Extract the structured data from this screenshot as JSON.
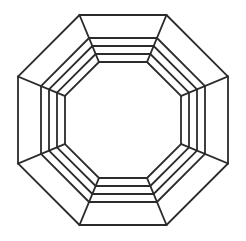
{
  "figure": {
    "type": "line-drawing",
    "background_color": "#ffffff",
    "stroke_color": "#2b2b2b",
    "stroke_width": 1.8,
    "canvas": {
      "width": 246,
      "height": 241
    },
    "center": {
      "x": 123,
      "y": 120
    },
    "rotation_degrees": 22.5,
    "ring_count": 8,
    "vertex_count": 8,
    "rings": [
      {
        "name": "ring-outer",
        "index": 0,
        "apothem": 105,
        "flat_top_y": 15,
        "flat_bottom_y": 225,
        "flat_left_x": 18,
        "flat_right_x": 228
      },
      {
        "name": "ring-second",
        "index": 1,
        "apothem": 82,
        "flat_top_y": 38,
        "flat_bottom_y": 202,
        "flat_left_x": 41,
        "flat_right_x": 205
      },
      {
        "name": "ring-third",
        "index": 2,
        "apothem": 74,
        "flat_top_y": 46,
        "flat_bottom_y": 194,
        "flat_left_x": 49,
        "flat_right_x": 197
      },
      {
        "name": "ring-fourth",
        "index": 3,
        "apothem": 66,
        "flat_top_y": 54,
        "flat_bottom_y": 186,
        "flat_left_x": 57,
        "flat_right_x": 189
      },
      {
        "name": "ring-inner",
        "index": 4,
        "apothem": 58,
        "flat_top_y": 62,
        "flat_bottom_y": 178,
        "flat_left_x": 65,
        "flat_right_x": 181
      }
    ],
    "connectors": [
      {
        "name": "connector-vertex-0",
        "angle_degrees": 22.5,
        "from_ring": 0,
        "to_ring": 4
      },
      {
        "name": "connector-vertex-1",
        "angle_degrees": 67.5,
        "from_ring": 0,
        "to_ring": 4
      },
      {
        "name": "connector-vertex-2",
        "angle_degrees": 112.5,
        "from_ring": 0,
        "to_ring": 4
      },
      {
        "name": "connector-vertex-3",
        "angle_degrees": 157.5,
        "from_ring": 0,
        "to_ring": 4
      },
      {
        "name": "connector-vertex-4",
        "angle_degrees": 202.5,
        "from_ring": 0,
        "to_ring": 4
      },
      {
        "name": "connector-vertex-5",
        "angle_degrees": 247.5,
        "from_ring": 0,
        "to_ring": 4
      },
      {
        "name": "connector-vertex-6",
        "angle_degrees": 292.5,
        "from_ring": 0,
        "to_ring": 4
      },
      {
        "name": "connector-vertex-7",
        "angle_degrees": 337.5,
        "from_ring": 0,
        "to_ring": 4
      }
    ]
  }
}
